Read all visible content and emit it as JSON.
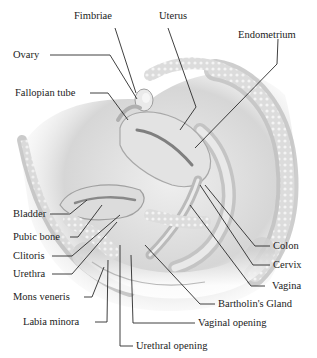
{
  "figure": {
    "type": "anatomical-illustration",
    "top_cut_text": ""
  },
  "labels": {
    "fimbriae": "Fimbriae",
    "uterus": "Uterus",
    "endometrium": "Endometrium",
    "ovary": "Ovary",
    "fallopian_tube": "Fallopian tube",
    "bladder": "Bladder",
    "pubic_bone": "Pubic bone",
    "clitoris": "Clitoris",
    "urethra": "Urethra",
    "mons_veneris": "Mons veneris",
    "labia_minora": "Labia minora",
    "urethral_opening": "Urethral opening",
    "vaginal_opening": "Vaginal opening",
    "bartholins_gland": "Bartholin's Gland",
    "vagina": "Vagina",
    "cervix": "Cervix",
    "colon": "Colon"
  },
  "colors": {
    "leader_line": "#2a2a2a",
    "tissue_light": "#e6e6e6",
    "tissue_mid": "#c9c9c9",
    "tissue_dark": "#9a9a9a"
  }
}
